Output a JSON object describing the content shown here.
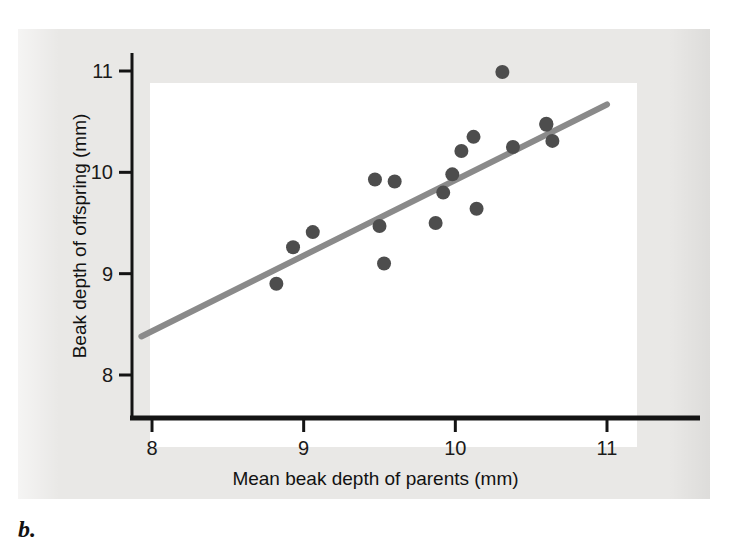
{
  "figure": {
    "panel_caption": "b.",
    "background_color": "#e9e8e6",
    "panel_color": "#ffffff"
  },
  "chart_data": {
    "type": "scatter",
    "title": "",
    "subtitle": "",
    "xlabel": "Mean beak depth of parents (mm)",
    "ylabel": "Beak depth of offspring (mm)",
    "xlim": [
      7.78,
      11.18
    ],
    "ylim": [
      7.58,
      11.22
    ],
    "xticks": [
      8,
      9,
      10,
      11
    ],
    "yticks": [
      8,
      9,
      10,
      11
    ],
    "xtick_labels": [
      "8",
      "9",
      "10",
      "11"
    ],
    "ytick_labels": [
      "8",
      "9",
      "10",
      "11"
    ],
    "grid": false,
    "legend": null,
    "point_color": "#4d4d4d",
    "point_radius_px": 7,
    "marker": "circle",
    "series": [
      {
        "name": "parent-offspring beak depth",
        "points": [
          {
            "x": 8.82,
            "y": 8.9
          },
          {
            "x": 8.93,
            "y": 9.26
          },
          {
            "x": 9.06,
            "y": 9.41
          },
          {
            "x": 9.5,
            "y": 9.47
          },
          {
            "x": 9.47,
            "y": 9.93
          },
          {
            "x": 9.6,
            "y": 9.91
          },
          {
            "x": 9.53,
            "y": 9.1
          },
          {
            "x": 9.87,
            "y": 9.5
          },
          {
            "x": 9.92,
            "y": 9.8
          },
          {
            "x": 9.98,
            "y": 9.98
          },
          {
            "x": 10.04,
            "y": 10.21
          },
          {
            "x": 10.12,
            "y": 10.35
          },
          {
            "x": 10.14,
            "y": 9.64
          },
          {
            "x": 10.31,
            "y": 10.99
          },
          {
            "x": 10.38,
            "y": 10.25
          },
          {
            "x": 10.6,
            "y": 10.48
          },
          {
            "x": 10.64,
            "y": 10.31
          },
          {
            "x": 10.6,
            "y": 10.47
          }
        ]
      }
    ],
    "trendline": {
      "name": "regression line",
      "color": "#8a8a8a",
      "width_px": 6,
      "x_start": 7.93,
      "y_start": 8.38,
      "x_end": 11.0,
      "y_end": 10.67
    }
  }
}
